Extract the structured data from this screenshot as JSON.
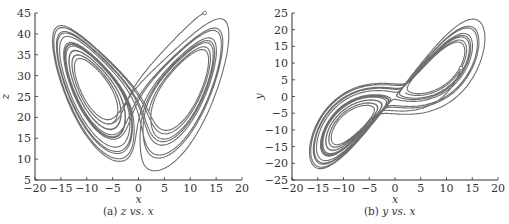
{
  "chart_data": [
    {
      "type": "line",
      "title": "",
      "caption_prefix": "(a)",
      "caption_y": "z",
      "caption_vs": "vs.",
      "caption_x": "x",
      "xlabel": "x",
      "ylabel": "z",
      "xlim": [
        -20,
        20
      ],
      "ylim": [
        5,
        45
      ],
      "xticks": [
        -20,
        -15,
        -10,
        -5,
        0,
        5,
        10,
        15,
        20
      ],
      "yticks": [
        5,
        10,
        15,
        20,
        25,
        30,
        35,
        40,
        45
      ],
      "grid": false,
      "legend": "none",
      "start_marker": {
        "x": 12.8,
        "z": 45
      },
      "description": "Lorenz attractor butterfly projection in x-z plane; two lobes centered near (-8.5, 27) and (8.5, 27)"
    },
    {
      "type": "line",
      "title": "",
      "caption_prefix": "(b)",
      "caption_y": "y",
      "caption_vs": "vs.",
      "caption_x": "x",
      "xlabel": "x",
      "ylabel": "y",
      "xlim": [
        -20,
        20
      ],
      "ylim": [
        -25,
        25
      ],
      "xticks": [
        -20,
        -15,
        -10,
        -5,
        0,
        5,
        10,
        15,
        20
      ],
      "yticks": [
        -25,
        -20,
        -15,
        -10,
        -5,
        0,
        5,
        10,
        15,
        20,
        25
      ],
      "grid": false,
      "legend": "none",
      "start_marker": {
        "x": 12.8,
        "y": 8.5
      },
      "description": "Lorenz attractor projection in x-y plane; lobes centered near (-10, -10) and (8, 8)"
    }
  ],
  "colors": {
    "line": "#6e6e6e",
    "axis": "#333333"
  }
}
